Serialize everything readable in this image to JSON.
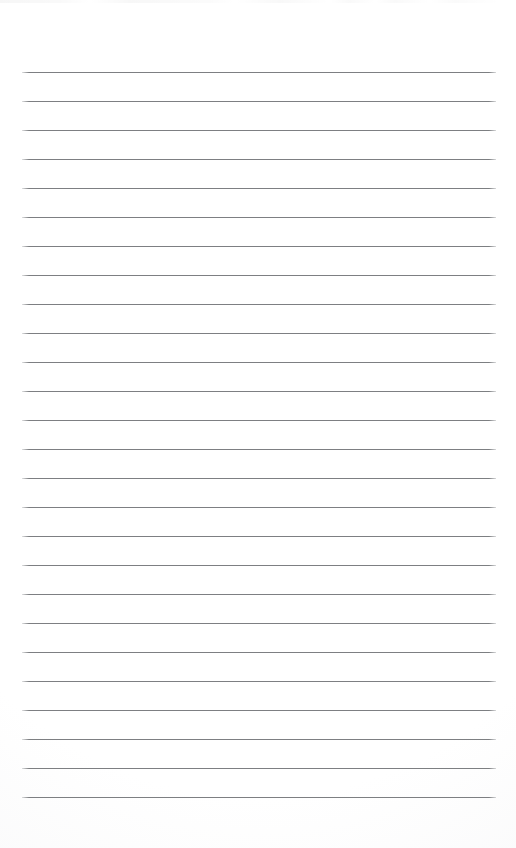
{
  "document": {
    "kind": "scanned-lined-paper",
    "title": "Lined Paper Sheet",
    "page_width": 516,
    "page_height": 848,
    "background_color": "#ffffff",
    "has_text_content": false,
    "has_handwriting": false,
    "notes": "Blank scanned sheet of ruled notebook paper; no text, headings, numbers or margins printed."
  },
  "ruling": {
    "line_color": "#7d7f82",
    "line_thickness_px": 1,
    "line_count": 26,
    "line_spacing_px": 29,
    "first_line_y": 72,
    "last_line_y": 797,
    "line_start_x": 22,
    "line_end_x": 496,
    "line_length_px": 474,
    "top_margin_px": 72,
    "bottom_margin_px": 51,
    "left_margin_px": 22,
    "right_margin_px": 20,
    "has_vertical_margin_rule": false,
    "lines": [
      {
        "index": 1,
        "y": 72
      },
      {
        "index": 2,
        "y": 101
      },
      {
        "index": 3,
        "y": 130
      },
      {
        "index": 4,
        "y": 159
      },
      {
        "index": 5,
        "y": 188
      },
      {
        "index": 6,
        "y": 217
      },
      {
        "index": 7,
        "y": 246
      },
      {
        "index": 8,
        "y": 275
      },
      {
        "index": 9,
        "y": 304
      },
      {
        "index": 10,
        "y": 333
      },
      {
        "index": 11,
        "y": 362
      },
      {
        "index": 12,
        "y": 391
      },
      {
        "index": 13,
        "y": 420
      },
      {
        "index": 14,
        "y": 449
      },
      {
        "index": 15,
        "y": 478
      },
      {
        "index": 16,
        "y": 507
      },
      {
        "index": 17,
        "y": 536
      },
      {
        "index": 18,
        "y": 565
      },
      {
        "index": 19,
        "y": 594
      },
      {
        "index": 20,
        "y": 623
      },
      {
        "index": 21,
        "y": 652
      },
      {
        "index": 22,
        "y": 681
      },
      {
        "index": 23,
        "y": 710
      },
      {
        "index": 24,
        "y": 739
      },
      {
        "index": 25,
        "y": 768
      },
      {
        "index": 26,
        "y": 797
      }
    ]
  },
  "artifacts": {
    "top_edge_noise": true,
    "top_edge_noise_height_px": 3,
    "paper_tone": "#f6f6f7"
  }
}
